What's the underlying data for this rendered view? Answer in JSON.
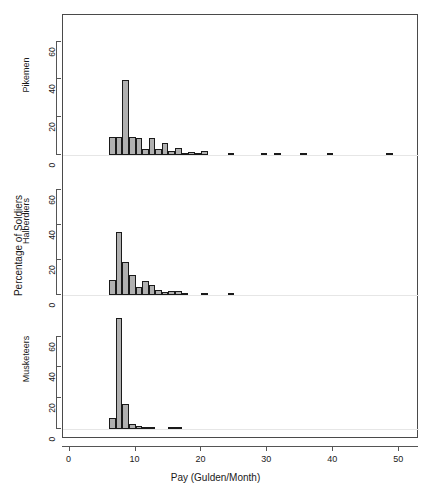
{
  "chart_data": {
    "type": "bar",
    "title": "",
    "subtitle": "",
    "xlabel": "Pay (Gulden/Month)",
    "ylabel": "Percentage of Soldiers",
    "xlim": [
      -1,
      53
    ],
    "xticks": [
      0,
      10,
      20,
      30,
      40,
      50
    ],
    "xticklabels": [
      "0",
      "10",
      "20",
      "30",
      "40",
      "50"
    ],
    "grid": false,
    "legend_position": "none",
    "layout": "3 stacked histogram panels sharing one x axis",
    "panels": [
      {
        "name": "Pikemen",
        "label": "Pikemen",
        "ylim": [
          0,
          72
        ],
        "yticks": [
          0,
          20,
          40,
          60
        ],
        "yticklabels": [
          "0",
          "20",
          "40",
          "60"
        ],
        "bin_width": 1,
        "bins": [
          {
            "x": 6,
            "value": 9.5
          },
          {
            "x": 7,
            "value": 9.5
          },
          {
            "x": 8,
            "value": 39.5
          },
          {
            "x": 9,
            "value": 9.8
          },
          {
            "x": 10,
            "value": 9.0
          },
          {
            "x": 11,
            "value": 3.0
          },
          {
            "x": 12,
            "value": 9.0
          },
          {
            "x": 13,
            "value": 3.3
          },
          {
            "x": 14,
            "value": 6.6
          },
          {
            "x": 15,
            "value": 2.0
          },
          {
            "x": 16,
            "value": 3.8
          },
          {
            "x": 17,
            "value": 1.0
          },
          {
            "x": 18,
            "value": 1.5
          },
          {
            "x": 19,
            "value": 0.8
          },
          {
            "x": 20,
            "value": 2.0
          },
          {
            "x": 24,
            "value": 0.5
          },
          {
            "x": 29,
            "value": 0.4
          },
          {
            "x": 31,
            "value": 0.4
          },
          {
            "x": 35,
            "value": 0.4
          },
          {
            "x": 39,
            "value": 0.5
          },
          {
            "x": 48,
            "value": 0.5
          }
        ]
      },
      {
        "name": "Halberdiers",
        "label": "Halberdiers",
        "ylim": [
          0,
          72
        ],
        "yticks": [
          0,
          20,
          40,
          60
        ],
        "yticklabels": [
          "0",
          "20",
          "40",
          "60"
        ],
        "bin_width": 1,
        "bins": [
          {
            "x": 6,
            "value": 8.5
          },
          {
            "x": 7,
            "value": 36.0
          },
          {
            "x": 8,
            "value": 19.0
          },
          {
            "x": 9,
            "value": 11.5
          },
          {
            "x": 10,
            "value": 4.5
          },
          {
            "x": 11,
            "value": 8.0
          },
          {
            "x": 12,
            "value": 5.5
          },
          {
            "x": 13,
            "value": 3.0
          },
          {
            "x": 14,
            "value": 1.5
          },
          {
            "x": 15,
            "value": 2.5
          },
          {
            "x": 16,
            "value": 2.5
          },
          {
            "x": 17,
            "value": 1.0
          },
          {
            "x": 20,
            "value": 1.0
          },
          {
            "x": 24,
            "value": 0.6
          }
        ]
      },
      {
        "name": "Musketeers",
        "label": "Musketeers",
        "ylim": [
          0,
          78
        ],
        "yticks": [
          0,
          20,
          40,
          60
        ],
        "yticklabels": [
          "0",
          "20",
          "40",
          "60"
        ],
        "bin_width": 1,
        "bins": [
          {
            "x": 6,
            "value": 7.0
          },
          {
            "x": 7,
            "value": 72.0
          },
          {
            "x": 8,
            "value": 16.0
          },
          {
            "x": 9,
            "value": 3.5
          },
          {
            "x": 10,
            "value": 2.0
          },
          {
            "x": 11,
            "value": 1.0
          },
          {
            "x": 12,
            "value": 0.6
          },
          {
            "x": 15,
            "value": 0.4
          },
          {
            "x": 16,
            "value": 0.4
          }
        ]
      }
    ],
    "colors": {
      "bar_fill": "#b0b0b0",
      "bar_edge": "#1a1a1a",
      "axis": "#555555",
      "text": "#1a1a1a",
      "background": "#ffffff"
    }
  }
}
